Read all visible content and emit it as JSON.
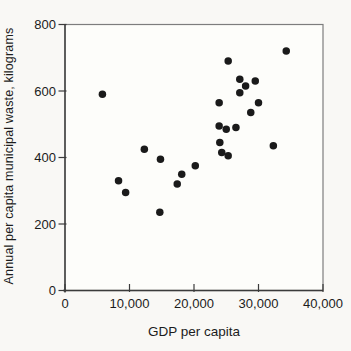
{
  "figure": {
    "background": "#f9f8f5",
    "plot_background": "#fdfdfa",
    "dot_color": "#1a1a1a",
    "axis_color": "#3b3b3b",
    "box_color": "#7d7d7d",
    "text_color": "#1c1c1c"
  },
  "chart_data": {
    "type": "scatter",
    "title": "",
    "xlabel": "GDP per capita",
    "ylabel": "Annual per capita municipal waste, kilograms",
    "xlim": [
      0,
      40000
    ],
    "ylim": [
      0,
      800
    ],
    "grid": false,
    "legend": null,
    "x_ticks": [
      {
        "value": 0,
        "label": "0"
      },
      {
        "value": 10000,
        "label": "10,000"
      },
      {
        "value": 20000,
        "label": "20,000"
      },
      {
        "value": 30000,
        "label": "30,000"
      },
      {
        "value": 40000,
        "label": "40,000"
      }
    ],
    "y_ticks": [
      {
        "value": 0,
        "label": "0"
      },
      {
        "value": 200,
        "label": "200"
      },
      {
        "value": 400,
        "label": "400"
      },
      {
        "value": 600,
        "label": "600"
      },
      {
        "value": 800,
        "label": "800"
      }
    ],
    "points": [
      [
        5800,
        590
      ],
      [
        8300,
        330
      ],
      [
        9400,
        295
      ],
      [
        12300,
        425
      ],
      [
        14800,
        395
      ],
      [
        14700,
        235
      ],
      [
        17400,
        320
      ],
      [
        18100,
        350
      ],
      [
        20200,
        375
      ],
      [
        23900,
        565
      ],
      [
        25300,
        690
      ],
      [
        27100,
        635
      ],
      [
        28000,
        615
      ],
      [
        29500,
        630
      ],
      [
        27100,
        595
      ],
      [
        30000,
        565
      ],
      [
        28800,
        535
      ],
      [
        23900,
        495
      ],
      [
        25000,
        485
      ],
      [
        26500,
        490
      ],
      [
        24000,
        445
      ],
      [
        24300,
        415
      ],
      [
        25300,
        405
      ],
      [
        32300,
        435
      ],
      [
        34300,
        720
      ]
    ]
  }
}
